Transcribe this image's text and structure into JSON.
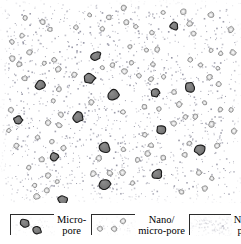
{
  "figure": {
    "type": "microstructure-schematic",
    "panel": {
      "width": 241,
      "height": 203,
      "background_color": "#ffffff"
    },
    "pore_classes": {
      "micro_pore": {
        "fill_color": "#6e6e6e",
        "stroke_color": "#1a1a1a",
        "approx_diameter_px": 10,
        "count": 16
      },
      "nano_micro_pore": {
        "fill_color": "#d8d8d8",
        "stroke_color": "#8a8a8a",
        "approx_diameter_px": 5,
        "count": 96
      },
      "nano_pore": {
        "fill_color": "#c9c9d2",
        "approx_diameter_px": 1,
        "count": 1500
      }
    },
    "micro_pores": [
      [
        174,
        26
      ],
      [
        96,
        56
      ],
      [
        89,
        78
      ],
      [
        40,
        85
      ],
      [
        113,
        95
      ],
      [
        155,
        93
      ],
      [
        190,
        87
      ],
      [
        78,
        117
      ],
      [
        161,
        130
      ],
      [
        105,
        147
      ],
      [
        54,
        157
      ],
      [
        157,
        174
      ],
      [
        105,
        184
      ],
      [
        63,
        200
      ],
      [
        200,
        150
      ],
      [
        18,
        120
      ]
    ]
  },
  "legend": {
    "items": [
      {
        "swatch": "micro-pore-swatch",
        "label_line1": "Micro-",
        "label_line2": "pore"
      },
      {
        "swatch": "nano-micro-pore-swatch",
        "label_line1": "Nano/",
        "label_line2": "micro-pore"
      },
      {
        "swatch": "nano-pore-swatch",
        "label_line1": "Nano-",
        "label_line2": "pore"
      }
    ]
  }
}
